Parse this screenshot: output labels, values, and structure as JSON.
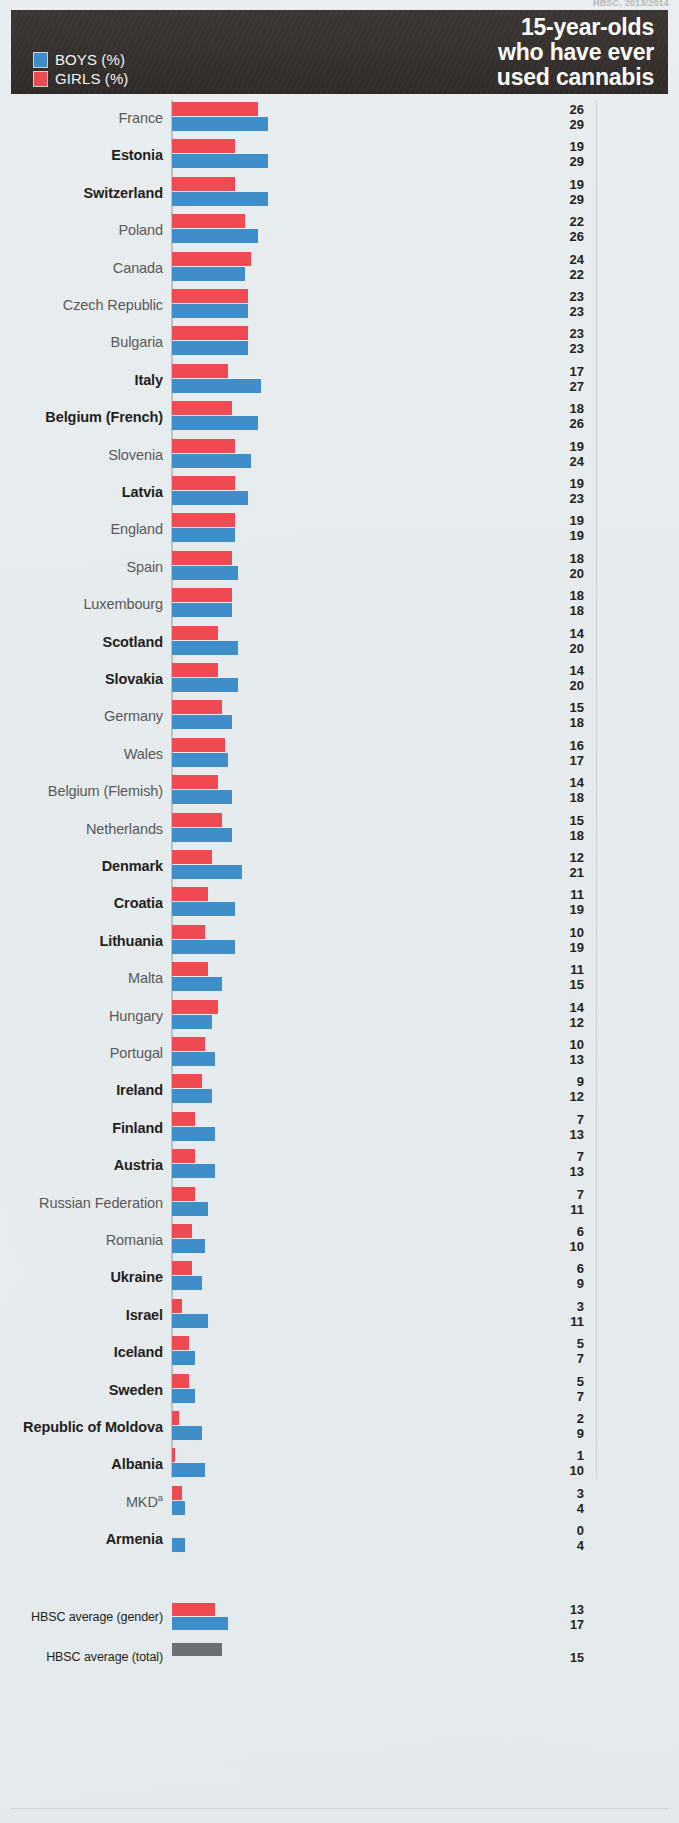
{
  "source_note": "HBSC, 2013/2014",
  "header": {
    "title_lines": [
      "15-year-olds",
      "who have ever",
      "used cannabis"
    ],
    "legend": [
      {
        "label": "BOYS (%)",
        "color": "#3f8ec9",
        "key": "boys"
      },
      {
        "label": "GIRLS (%)",
        "color": "#ef4a52",
        "key": "girls"
      }
    ]
  },
  "averages": {
    "gender_label": "HBSC average (gender)",
    "gender_girls": 13,
    "gender_boys": 17,
    "total_label": "HBSC average (total)",
    "total_value": 15,
    "total_color": "#6d6e71"
  },
  "chart_data": {
    "type": "bar",
    "title": "15-year-olds who have ever used cannabis",
    "xlabel": "",
    "ylabel": "",
    "xlim": [
      0,
      30
    ],
    "grid": false,
    "legend_position": "top-left",
    "orientation": "horizontal",
    "note": "Each country shows a GIRLS (%) bar on top and a BOYS (%) bar below; printed values are girls then boys. Bold country names indicate a significant gender difference.",
    "categories": [
      "France",
      "Estonia",
      "Switzerland",
      "Poland",
      "Canada",
      "Czech Republic",
      "Bulgaria",
      "Italy",
      "Belgium (French)",
      "Slovenia",
      "Latvia",
      "England",
      "Spain",
      "Luxembourg",
      "Scotland",
      "Slovakia",
      "Germany",
      "Wales",
      "Belgium (Flemish)",
      "Netherlands",
      "Denmark",
      "Croatia",
      "Lithuania",
      "Malta",
      "Hungary",
      "Portugal",
      "Ireland",
      "Finland",
      "Austria",
      "Russian Federation",
      "Romania",
      "Ukraine",
      "Israel",
      "Iceland",
      "Sweden",
      "Republic of Moldova",
      "Albania",
      "MKD",
      "Armenia"
    ],
    "series": [
      {
        "name": "GIRLS (%)",
        "color": "#ef4a52",
        "values": [
          26,
          19,
          19,
          22,
          24,
          23,
          23,
          17,
          18,
          19,
          19,
          19,
          18,
          18,
          14,
          14,
          15,
          16,
          14,
          15,
          12,
          11,
          10,
          11,
          14,
          10,
          9,
          7,
          7,
          7,
          6,
          6,
          3,
          5,
          5,
          2,
          1,
          3,
          0
        ]
      },
      {
        "name": "BOYS (%)",
        "color": "#3f8ec9",
        "values": [
          29,
          29,
          29,
          26,
          22,
          23,
          23,
          27,
          26,
          24,
          23,
          19,
          20,
          18,
          20,
          20,
          18,
          17,
          18,
          18,
          21,
          19,
          19,
          15,
          12,
          13,
          12,
          13,
          13,
          11,
          10,
          9,
          11,
          7,
          7,
          9,
          10,
          4,
          4
        ]
      }
    ],
    "bold_categories": [
      "Estonia",
      "Switzerland",
      "Italy",
      "Belgium (French)",
      "Latvia",
      "Scotland",
      "Slovakia",
      "Denmark",
      "Croatia",
      "Lithuania",
      "Ireland",
      "Finland",
      "Austria",
      "Ukraine",
      "Israel",
      "Iceland",
      "Sweden",
      "Republic of Moldova",
      "Albania",
      "Armenia"
    ],
    "footnote_markers": {
      "MKD": "a"
    },
    "hbsc_average_gender": {
      "girls": 13,
      "boys": 17
    },
    "hbsc_average_total": 15
  }
}
